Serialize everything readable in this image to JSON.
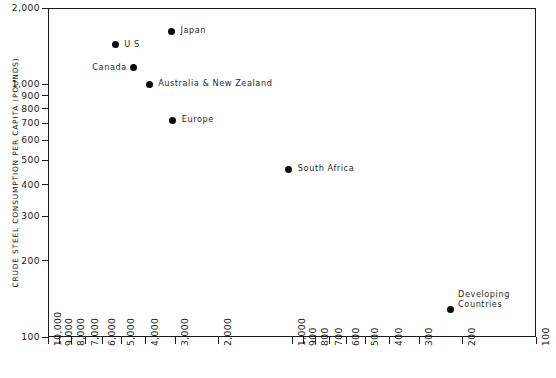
{
  "chart": {
    "type": "scatter",
    "ylabel": "CRUDE STEEL CONSUMPTION PER CAPITA (POUNDS)",
    "xlabel": ""
  },
  "y_axis": {
    "ticks": [
      {
        "value": 2000,
        "label": "2,000"
      },
      {
        "value": 1000,
        "label": "1,000"
      },
      {
        "value": 900,
        "label": "900"
      },
      {
        "value": 800,
        "label": "800"
      },
      {
        "value": 700,
        "label": "700"
      },
      {
        "value": 600,
        "label": "600"
      },
      {
        "value": 500,
        "label": "500"
      },
      {
        "value": 400,
        "label": "400"
      },
      {
        "value": 300,
        "label": "300"
      },
      {
        "value": 200,
        "label": "200"
      },
      {
        "value": 100,
        "label": "100"
      }
    ],
    "scale": "log",
    "min": 100,
    "max": 2000
  },
  "x_axis": {
    "ticks": [
      {
        "value": 10000,
        "label": "10,000"
      },
      {
        "value": 9000,
        "label": "9,000"
      },
      {
        "value": 8000,
        "label": "8,000"
      },
      {
        "value": 7000,
        "label": "7,000"
      },
      {
        "value": 6000,
        "label": "6,000"
      },
      {
        "value": 5000,
        "label": "5,000"
      },
      {
        "value": 4000,
        "label": "4,000"
      },
      {
        "value": 3000,
        "label": "3,000"
      },
      {
        "value": 2000,
        "label": "2,000"
      },
      {
        "value": 1000,
        "label": "1,000"
      },
      {
        "value": 900,
        "label": "900"
      },
      {
        "value": 800,
        "label": "800"
      },
      {
        "value": 700,
        "label": "700"
      },
      {
        "value": 600,
        "label": "600"
      },
      {
        "value": 500,
        "label": "500"
      },
      {
        "value": 400,
        "label": "400"
      },
      {
        "value": 300,
        "label": "300"
      },
      {
        "value": 200,
        "label": "200"
      },
      {
        "value": 100,
        "label": "100"
      }
    ],
    "scale": "log-reversed",
    "min": 100,
    "max": 10000
  },
  "chart_data": {
    "type": "scatter",
    "title": "",
    "xlabel": "",
    "ylabel": "CRUDE STEEL CONSUMPTION PER CAPITA (POUNDS)",
    "xscale": "log",
    "yscale": "log",
    "x_reversed": true,
    "xlim": [
      10000,
      100
    ],
    "ylim": [
      100,
      2000
    ],
    "grid": false,
    "legend": false,
    "points": [
      {
        "name": "U S",
        "x": 5300,
        "y": 1430,
        "label": "U S",
        "label_side": "right"
      },
      {
        "name": "Japan",
        "x": 3120,
        "y": 1620,
        "label": "Japan",
        "label_side": "right"
      },
      {
        "name": "Canada",
        "x": 4450,
        "y": 1160,
        "label": "Canada",
        "label_side": "left"
      },
      {
        "name": "Australia & New Zealand",
        "x": 3850,
        "y": 1000,
        "label": "Australia & New Zealand",
        "label_side": "right"
      },
      {
        "name": "Europe",
        "x": 3080,
        "y": 720,
        "label": "Europe",
        "label_side": "right"
      },
      {
        "name": "South Africa",
        "x": 1030,
        "y": 460,
        "label": "South Africa",
        "label_side": "right"
      },
      {
        "name": "Developing Countries",
        "x": 225,
        "y": 128,
        "label": "Developing\nCountries",
        "label_side": "right-block"
      }
    ]
  }
}
